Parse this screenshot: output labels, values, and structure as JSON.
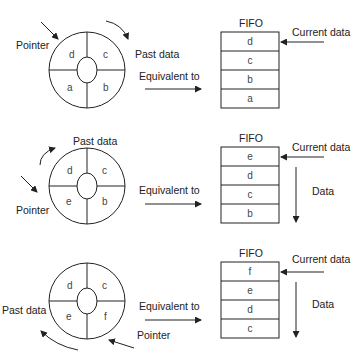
{
  "panels": [
    {
      "ring": {
        "top_left": "d",
        "top_right": "c",
        "bottom_left": "a",
        "bottom_right": "b"
      },
      "pointer_label": "Pointer",
      "past_label": "Past data",
      "equiv_label": "Equivalent to",
      "fifo": {
        "title": "FIFO",
        "cells": [
          "d",
          "c",
          "b",
          "a"
        ],
        "current_label": "Current data"
      }
    },
    {
      "ring": {
        "top_left": "d",
        "top_right": "c",
        "bottom_left": "e",
        "bottom_right": "b"
      },
      "pointer_label": "Pointer",
      "past_label": "Past data",
      "equiv_label": "Equivalent to",
      "fifo": {
        "title": "FIFO",
        "cells": [
          "e",
          "d",
          "c",
          "b"
        ],
        "current_label": "Current data",
        "data_label": "Data"
      }
    },
    {
      "ring": {
        "top_left": "d",
        "top_right": "c",
        "bottom_left": "e",
        "bottom_right": "f"
      },
      "pointer_label": "Pointer",
      "past_label": "Past data",
      "equiv_label": "Equivalent to",
      "fifo": {
        "title": "FIFO",
        "cells": [
          "f",
          "e",
          "d",
          "c"
        ],
        "current_label": "Current data",
        "data_label": "Data"
      }
    }
  ]
}
